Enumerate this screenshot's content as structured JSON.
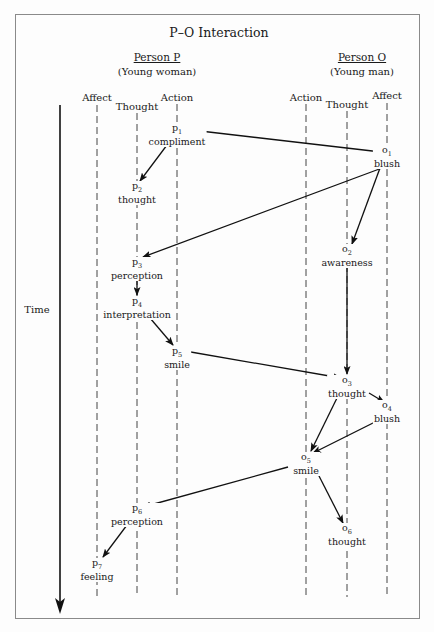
{
  "title": "P–O Interaction",
  "persons": [
    {
      "name": "Person P",
      "desc": "(Young woman)",
      "x": 137
    },
    {
      "name": "Person O",
      "desc": "(Young man)",
      "x": 347
    }
  ],
  "columns": [
    {
      "id": "p-affect",
      "label": "Affect",
      "x": 97,
      "label_y": 98
    },
    {
      "id": "p-thought",
      "label": "Thought",
      "x": 137,
      "label_y": 106
    },
    {
      "id": "p-action",
      "label": "Action",
      "x": 177,
      "label_y": 98
    },
    {
      "id": "o-action",
      "label": "Action",
      "x": 306,
      "label_y": 98
    },
    {
      "id": "o-thought",
      "label": "Thought",
      "x": 347,
      "label_y": 106
    },
    {
      "id": "o-affect",
      "label": "Affect",
      "x": 387,
      "label_y": 96
    }
  ],
  "time_axis": {
    "label": "Time",
    "x": 60,
    "y_start": 105,
    "y_end": 622
  },
  "nodes": [
    {
      "id": "p1",
      "sym": "p",
      "sub": "1",
      "label": "compliment",
      "x": 177,
      "y": 128
    },
    {
      "id": "p2",
      "sym": "p",
      "sub": "2",
      "label": "thought",
      "x": 137,
      "y": 186
    },
    {
      "id": "o1",
      "sym": "o",
      "sub": "1",
      "label": "blush",
      "x": 387,
      "y": 150
    },
    {
      "id": "o2",
      "sym": "o",
      "sub": "2",
      "label": "awareness",
      "x": 347,
      "y": 249
    },
    {
      "id": "p3",
      "sym": "p",
      "sub": "3",
      "label": "perception",
      "x": 137,
      "y": 262
    },
    {
      "id": "p4",
      "sym": "p",
      "sub": "4",
      "label": "interpretation",
      "x": 137,
      "y": 301
    },
    {
      "id": "p5",
      "sym": "p",
      "sub": "5",
      "label": "smile",
      "x": 177,
      "y": 351
    },
    {
      "id": "o3",
      "sym": "o",
      "sub": "3",
      "label": "thought",
      "x": 347,
      "y": 380
    },
    {
      "id": "o4",
      "sym": "o",
      "sub": "4",
      "label": "blush",
      "x": 387,
      "y": 405
    },
    {
      "id": "o5",
      "sym": "o",
      "sub": "5",
      "label": "smile",
      "x": 306,
      "y": 457
    },
    {
      "id": "p6",
      "sym": "p",
      "sub": "6",
      "label": "perception",
      "x": 137,
      "y": 508
    },
    {
      "id": "o6",
      "sym": "o",
      "sub": "6",
      "label": "thought",
      "x": 347,
      "y": 528
    },
    {
      "id": "p7",
      "sym": "p",
      "sub": "7",
      "label": "feeling",
      "x": 97,
      "y": 563
    }
  ],
  "edges": [
    {
      "from": "p1",
      "to": "o1",
      "x1": 183,
      "y1": 129,
      "x2": 381,
      "y2": 152
    },
    {
      "from": "p1",
      "to": "p2",
      "x1": 167,
      "y1": 145,
      "x2": 140,
      "y2": 181
    },
    {
      "from": "o1",
      "to": "p3",
      "x1": 382,
      "y1": 168,
      "x2": 143,
      "y2": 257
    },
    {
      "from": "o1",
      "to": "o2",
      "x1": 380,
      "y1": 168,
      "x2": 352,
      "y2": 244
    },
    {
      "from": "p3",
      "to": "p4",
      "x1": 137,
      "y1": 279,
      "x2": 137,
      "y2": 295
    },
    {
      "from": "p4",
      "to": "p5",
      "x1": 150,
      "y1": 318,
      "x2": 173,
      "y2": 345
    },
    {
      "from": "p5",
      "to": "o3",
      "x1": 185,
      "y1": 351,
      "x2": 341,
      "y2": 378
    },
    {
      "from": "o2",
      "to": "o3",
      "x1": 347,
      "y1": 268,
      "x2": 347,
      "y2": 374
    },
    {
      "from": "o3",
      "to": "o4",
      "x1": 369,
      "y1": 393,
      "x2": 384,
      "y2": 402
    },
    {
      "from": "o3",
      "to": "o5",
      "x1": 337,
      "y1": 398,
      "x2": 311,
      "y2": 451
    },
    {
      "from": "o4",
      "to": "o5",
      "x1": 377,
      "y1": 421,
      "x2": 313,
      "y2": 453
    },
    {
      "from": "o5",
      "to": "p6",
      "x1": 288,
      "y1": 467,
      "x2": 143,
      "y2": 507
    },
    {
      "from": "o5",
      "to": "o6",
      "x1": 318,
      "y1": 474,
      "x2": 343,
      "y2": 523
    },
    {
      "from": "p6",
      "to": "p7",
      "x1": 127,
      "y1": 525,
      "x2": 103,
      "y2": 557
    }
  ]
}
